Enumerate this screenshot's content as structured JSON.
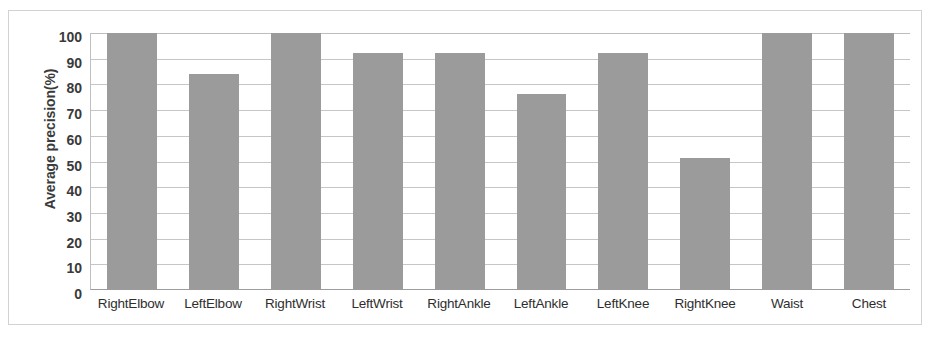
{
  "chart_data": {
    "type": "bar",
    "title": "",
    "xlabel": "",
    "ylabel": "Average precision(%)",
    "ylim": [
      0,
      100
    ],
    "ytick_step": 10,
    "yticks": [
      100,
      90,
      80,
      70,
      60,
      50,
      40,
      30,
      20,
      10,
      0
    ],
    "grid": true,
    "legend": false,
    "categories": [
      "RightElbow",
      "LeftElbow",
      "RightWrist",
      "LeftWrist",
      "RightAnkle",
      "LeftAnkle",
      "LeftKnee",
      "RightKnee",
      "Waist",
      "Chest"
    ],
    "values": [
      100,
      84,
      100,
      92,
      92,
      76,
      92,
      51,
      100,
      100
    ],
    "bar_color": "#9b9b9b",
    "plot_background": "#ffffff",
    "gridline_color": "#c6c6c6",
    "axis_color": "#9c9c9c",
    "frame_color": "#d2d2d2"
  }
}
